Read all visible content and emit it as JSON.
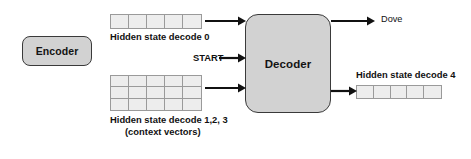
{
  "diagram": {
    "title_text": null,
    "colors": {
      "box_fill": "#d2d2d2",
      "box_border": "#3a3a3a",
      "grid_fill": "#ededed",
      "grid_border": "#9a9a9a",
      "arrow": "#111111",
      "text": "#111111",
      "background": "#ffffff"
    },
    "nodes": {
      "encoder": {
        "label": "Encoder"
      },
      "decoder": {
        "label": "Decoder"
      }
    },
    "grids": {
      "hidden_state_0": {
        "label": "Hidden state decode 0",
        "rows": 1,
        "cols": 5
      },
      "context_vectors": {
        "label_line1": "Hidden state decode 1,2, 3",
        "label_line2": "(context vectors)",
        "rows": 3,
        "cols": 5
      },
      "hidden_state_4": {
        "label": "Hidden state decode 4",
        "rows": 1,
        "cols": 5
      }
    },
    "inputs": {
      "start_token": "START"
    },
    "outputs": {
      "word": "Dove"
    }
  }
}
